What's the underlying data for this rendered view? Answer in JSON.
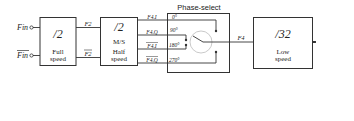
{
  "diagram": {
    "inputs": {
      "fin": "Fin",
      "fin_bar": "Fin"
    },
    "full_speed_block": {
      "ratio": "/2",
      "label_line1": "Full",
      "label_line2": "speed"
    },
    "signals_f2": {
      "f2": "F2",
      "f2_bar": "F2"
    },
    "half_speed_block": {
      "ratio": "/2",
      "mode": "M/S",
      "label_line1": "Half",
      "label_line2": "speed"
    },
    "phase_outputs": [
      {
        "signal": "F4.I",
        "bar": false,
        "phase": "0°"
      },
      {
        "signal": "F4.Q",
        "bar": false,
        "phase": "90°"
      },
      {
        "signal": "F4.I",
        "bar": true,
        "phase": "180°"
      },
      {
        "signal": "F4.Q",
        "bar": true,
        "phase": "270°"
      }
    ],
    "phase_select": {
      "title": "Phase-select"
    },
    "f4_signal": "F4",
    "low_speed_block": {
      "ratio": "/32",
      "label_line1": "Low",
      "label_line2": "speed"
    },
    "output": "Fout",
    "ctrl_signal": "Ctrl",
    "frequency_control": {
      "label_line1": "Frequency",
      "label_line2": "Control"
    },
    "mode_input": "Mode",
    "colors": {
      "line": "#333333",
      "text": "#222222",
      "background": "#ffffff"
    }
  }
}
